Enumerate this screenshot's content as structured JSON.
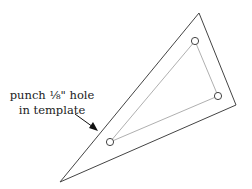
{
  "diagram": {
    "label_line1": "punch ⅛\" hole",
    "label_line2": "in template",
    "colors": {
      "outline": "#444444",
      "inner": "#999999",
      "arrow": "#111111"
    },
    "outer_triangle": [
      [
        199,
        13
      ],
      [
        236,
        105
      ],
      [
        60,
        182
      ]
    ],
    "inner_holes": [
      [
        195,
        41
      ],
      [
        218,
        96
      ],
      [
        110,
        142
      ]
    ]
  }
}
